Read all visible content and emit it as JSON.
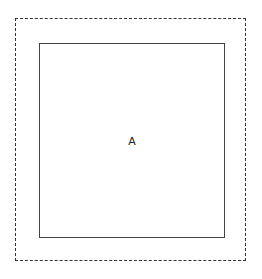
{
  "diagram": {
    "outer_box": {
      "style": "dashed",
      "color": "#333333"
    },
    "inner_box": {
      "style": "solid",
      "color": "#444444",
      "label": "A"
    }
  }
}
